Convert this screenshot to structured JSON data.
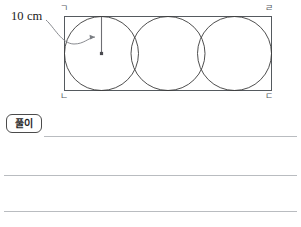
{
  "figure": {
    "type": "geometry-diagram",
    "dimension_label": "10 cm",
    "vertex_labels": {
      "top_left": "ㄱ",
      "top_right": "ㄹ",
      "bottom_left": "ㄴ",
      "bottom_right": "ㄷ"
    },
    "rectangle": {
      "x": 64,
      "y": 16,
      "width": 208,
      "height": 75,
      "stroke": "#555a5f",
      "stroke_width": 1,
      "fill": "none"
    },
    "circles": [
      {
        "cx": 101.5,
        "cy": 53.5,
        "r": 37.5
      },
      {
        "cx": 168.0,
        "cy": 53.5,
        "r": 37.5
      },
      {
        "cx": 234.5,
        "cy": 53.5,
        "r": 37.5
      }
    ],
    "circle_stroke": "#3a3a3a",
    "circle_stroke_width": 0.9,
    "radius_marker": {
      "line_x": 101.5,
      "line_y_top": 16.5,
      "line_y_bottom": 53.5,
      "center_dot_r": 1.6,
      "stroke": "#6e6e73"
    },
    "leader_arrow": {
      "start_x": 46,
      "start_y": 20,
      "end_x": 95,
      "end_y": 37,
      "stroke": "#7a7d82"
    }
  },
  "solution": {
    "badge_label": "풀이",
    "lines": [
      {
        "id": "answer-line-1"
      },
      {
        "id": "answer-line-2"
      },
      {
        "id": "answer-line-3"
      }
    ]
  },
  "colors": {
    "page_background": "#ffffff",
    "rule_line": "#b9bcc0",
    "figure_stroke": "#555a5f",
    "text": "#1a1a1a"
  }
}
